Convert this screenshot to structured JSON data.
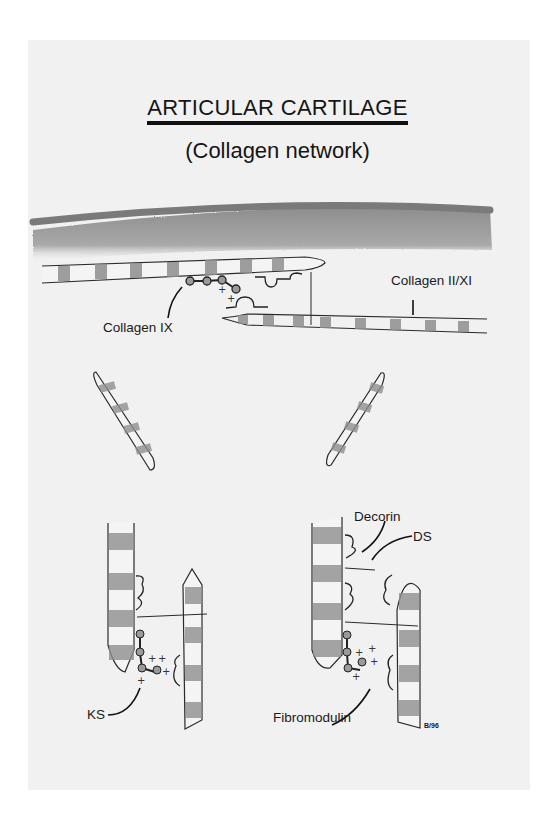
{
  "figure": {
    "title": "ARTICULAR CARTILAGE",
    "subtitle": "(Collagen network)",
    "labels": {
      "collagen_ix": "Collagen IX",
      "collagen_ii_xi": "Collagen II/XI",
      "decorin": "Decorin",
      "ds": "DS",
      "ks": "KS",
      "fibromodulin": "Fibromodulin",
      "signature": "B/96"
    },
    "colors": {
      "page": "#f1f1f1",
      "surface_band": "#8a8a8a",
      "surface_shading": "#9e9e9e",
      "fibril_band": "#8f8f8f",
      "outline": "#2a2a2a"
    }
  }
}
